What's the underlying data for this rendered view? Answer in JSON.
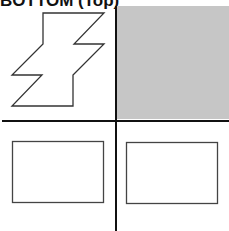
{
  "title": "BOTTOM (Top)",
  "colors": {
    "background": "#ffffff",
    "shaded_quadrant": "#c6c6c6",
    "lines": "#111111",
    "shape_stroke": "#333333"
  },
  "quadrants": {
    "top_left": {
      "content": "zigzag-bolt-shape",
      "shaded": false
    },
    "top_right": {
      "content": "empty",
      "shaded": true
    },
    "bottom_left": {
      "content": "rectangle",
      "shaded": false
    },
    "bottom_right": {
      "content": "rectangle",
      "shaded": false
    }
  }
}
